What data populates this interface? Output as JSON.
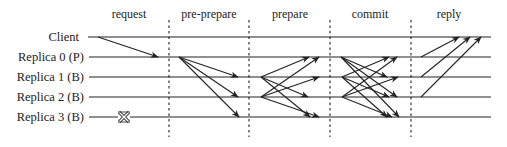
{
  "diagram": {
    "phases": [
      {
        "label": "request",
        "x": 129
      },
      {
        "label": "pre-prepare",
        "x": 209
      },
      {
        "label": "prepare",
        "x": 290
      },
      {
        "label": "commit",
        "x": 370
      },
      {
        "label": "reply",
        "x": 449
      }
    ],
    "dividers_x": [
      169,
      249,
      330,
      411
    ],
    "nodes": [
      {
        "label": "Client",
        "y": 37
      },
      {
        "label": "Replica 0 (P)",
        "y": 57
      },
      {
        "label": "Replica 1 (B)",
        "y": 77
      },
      {
        "label": "Replica 2 (B)",
        "y": 97
      },
      {
        "label": "Replica 3 (B)",
        "y": 117
      }
    ],
    "faulty_node": {
      "label": "Replica 3 (B)",
      "marker": "crossed-box-icon",
      "x": 124
    },
    "colors": {
      "line": "#222222",
      "background": "#ffffff"
    }
  }
}
